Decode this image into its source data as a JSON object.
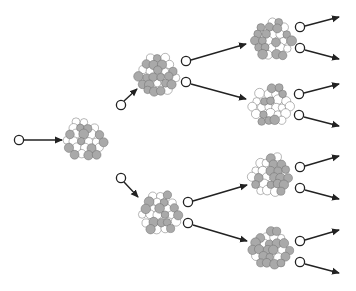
{
  "diagram": {
    "title": "",
    "colors": {
      "background": "#ffffff",
      "cell_fill_gray": "#a9a9a9",
      "cell_fill_white": "#ffffff",
      "cell_stroke": "#6e6e6e",
      "line": "#222222",
      "node_stroke": "#222222"
    },
    "input_node": {
      "x": 19,
      "y": 140
    },
    "clusters": [
      {
        "id": "c1",
        "cx": 85,
        "cy": 140,
        "r": 23,
        "level": 0,
        "seed": 1
      },
      {
        "id": "c2",
        "cx": 158,
        "cy": 76,
        "r": 23,
        "level": 1,
        "seed": 2
      },
      {
        "id": "c3",
        "cx": 161,
        "cy": 214,
        "r": 23,
        "level": 1,
        "seed": 3
      },
      {
        "id": "c4",
        "cx": 273,
        "cy": 40,
        "r": 23,
        "level": 2,
        "seed": 4
      },
      {
        "id": "c5",
        "cx": 272,
        "cy": 106,
        "r": 23,
        "level": 2,
        "seed": 5
      },
      {
        "id": "c6",
        "cx": 271,
        "cy": 176,
        "r": 23,
        "level": 2,
        "seed": 6
      },
      {
        "id": "c7",
        "cx": 271,
        "cy": 249,
        "r": 23,
        "level": 2,
        "seed": 7
      }
    ],
    "nodes": [
      {
        "id": "in",
        "x": 19,
        "y": 140
      },
      {
        "id": "n2in",
        "x": 121,
        "y": 105
      },
      {
        "id": "n3in",
        "x": 121,
        "y": 178
      },
      {
        "id": "c2a",
        "x": 186,
        "y": 61
      },
      {
        "id": "c2b",
        "x": 186,
        "y": 82
      },
      {
        "id": "c3a",
        "x": 188,
        "y": 202
      },
      {
        "id": "c3b",
        "x": 188,
        "y": 223
      },
      {
        "id": "c4a",
        "x": 300,
        "y": 27
      },
      {
        "id": "c4b",
        "x": 300,
        "y": 48
      },
      {
        "id": "c5a",
        "x": 299,
        "y": 94
      },
      {
        "id": "c5b",
        "x": 299,
        "y": 115
      },
      {
        "id": "c6a",
        "x": 300,
        "y": 167
      },
      {
        "id": "c6b",
        "x": 300,
        "y": 188
      },
      {
        "id": "c7a",
        "x": 300,
        "y": 241
      },
      {
        "id": "c7b",
        "x": 300,
        "y": 262
      }
    ],
    "edges": [
      {
        "x1": 24,
        "y1": 140,
        "x2": 62,
        "y2": 140
      },
      {
        "x1": 124,
        "y1": 101,
        "x2": 137,
        "y2": 89
      },
      {
        "x1": 124,
        "y1": 182,
        "x2": 138,
        "y2": 197
      },
      {
        "x1": 191,
        "y1": 60,
        "x2": 246,
        "y2": 44
      },
      {
        "x1": 191,
        "y1": 84,
        "x2": 246,
        "y2": 99
      },
      {
        "x1": 193,
        "y1": 201,
        "x2": 247,
        "y2": 185
      },
      {
        "x1": 193,
        "y1": 225,
        "x2": 247,
        "y2": 241
      },
      {
        "x1": 305,
        "y1": 26,
        "x2": 339,
        "y2": 17
      },
      {
        "x1": 305,
        "y1": 50,
        "x2": 339,
        "y2": 59
      },
      {
        "x1": 304,
        "y1": 93,
        "x2": 339,
        "y2": 84
      },
      {
        "x1": 304,
        "y1": 117,
        "x2": 339,
        "y2": 126
      },
      {
        "x1": 305,
        "y1": 166,
        "x2": 339,
        "y2": 156
      },
      {
        "x1": 305,
        "y1": 190,
        "x2": 339,
        "y2": 199
      },
      {
        "x1": 305,
        "y1": 240,
        "x2": 339,
        "y2": 230
      },
      {
        "x1": 305,
        "y1": 264,
        "x2": 339,
        "y2": 273
      }
    ]
  }
}
